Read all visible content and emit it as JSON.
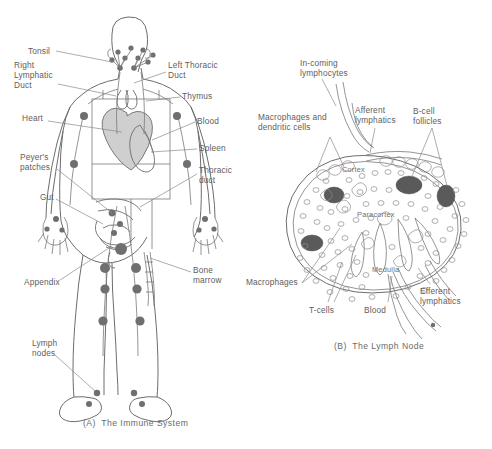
{
  "figure": {
    "title_a": "(A)  The Immune System",
    "title_b": "(B)  The Lymph Node",
    "ink_color": "#6d6d6d",
    "text_color": "#5e5e5e",
    "background": "#ffffff"
  },
  "panel_a": {
    "caption": "(A)  The Immune System",
    "labels": [
      {
        "id": "tonsil",
        "text": "Tonsil",
        "x": 28,
        "y": 50,
        "align": "left"
      },
      {
        "id": "right-lymphatic-duct",
        "text": "Right\nLymphatic\nDuct",
        "x": 14,
        "y": 62,
        "align": "left"
      },
      {
        "id": "heart",
        "text": "Heart",
        "x": 22,
        "y": 117,
        "align": "left"
      },
      {
        "id": "peyers-patches",
        "text": "Peyer's\npatches",
        "x": 20,
        "y": 156,
        "align": "left"
      },
      {
        "id": "gut",
        "text": "Gut",
        "x": 40,
        "y": 196,
        "align": "left"
      },
      {
        "id": "appendix",
        "text": "Appendix",
        "x": 24,
        "y": 282,
        "align": "left"
      },
      {
        "id": "lymph-nodes",
        "text": "Lymph\nnodes",
        "x": 32,
        "y": 340,
        "align": "left"
      },
      {
        "id": "left-thoracic-duct",
        "text": "Left Thoracic\nDuct",
        "x": 168,
        "y": 62,
        "align": "left"
      },
      {
        "id": "thymus",
        "text": "Thymus",
        "x": 182,
        "y": 94,
        "align": "left"
      },
      {
        "id": "blood",
        "text": "Blood",
        "x": 197,
        "y": 117,
        "align": "left"
      },
      {
        "id": "spleen",
        "text": "Spleen",
        "x": 199,
        "y": 145,
        "align": "left"
      },
      {
        "id": "thoracic-duct",
        "text": "Thoracic\nduct",
        "x": 199,
        "y": 166,
        "align": "left"
      },
      {
        "id": "bone-marrow",
        "text": "Bone\nmarrow",
        "x": 193,
        "y": 268,
        "align": "left"
      }
    ]
  },
  "panel_b": {
    "caption": "(B)  The Lymph Node",
    "labels": [
      {
        "id": "incoming-lymphocytes",
        "text": "In-coming\nlymphocytes",
        "x": 300,
        "y": 60,
        "align": "left"
      },
      {
        "id": "macrophages-dendritic",
        "text": "Macrophages and\ndendritic cells",
        "x": 258,
        "y": 114,
        "align": "left"
      },
      {
        "id": "afferent-lymphatics",
        "text": "Afferent\nlymphatics",
        "x": 355,
        "y": 107,
        "align": "left"
      },
      {
        "id": "b-cell-follicles",
        "text": "B-cell\nfollicles",
        "x": 413,
        "y": 108,
        "align": "left"
      },
      {
        "id": "cortex",
        "text": "Cortex",
        "x": 342,
        "y": 167,
        "align": "left"
      },
      {
        "id": "paracortex",
        "text": "Paracortex",
        "x": 357,
        "y": 212,
        "align": "left"
      },
      {
        "id": "medulla",
        "text": "Medulla",
        "x": 372,
        "y": 267,
        "align": "left"
      },
      {
        "id": "macrophages",
        "text": "Macrophages",
        "x": 246,
        "y": 279,
        "align": "left"
      },
      {
        "id": "t-cells",
        "text": "T-cells",
        "x": 309,
        "y": 307,
        "align": "left"
      },
      {
        "id": "blood",
        "text": "Blood",
        "x": 364,
        "y": 307,
        "align": "left"
      },
      {
        "id": "efferent-lymphatics",
        "text": "Efferent\nlymphatics",
        "x": 420,
        "y": 288,
        "align": "left"
      }
    ]
  }
}
